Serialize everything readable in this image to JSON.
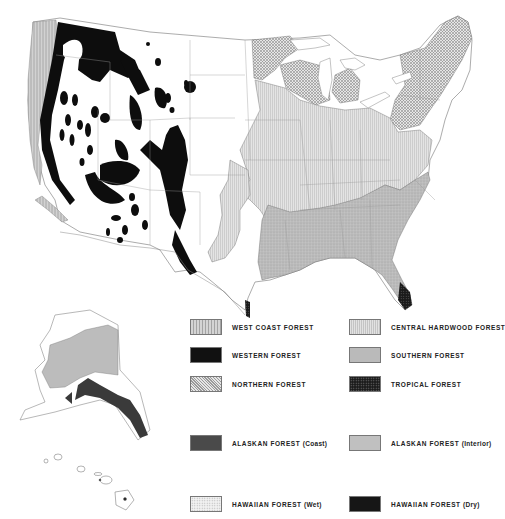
{
  "map": {
    "subject": "Forest regions of the United States",
    "regions_shown": [
      "Contiguous United States",
      "Alaska",
      "Hawaii"
    ]
  },
  "legend": {
    "items": [
      {
        "id": "west-coast",
        "label": "WEST COAST FOREST",
        "sub": "",
        "color": "#c4c4c4",
        "pattern": "vertical-lines"
      },
      {
        "id": "western",
        "label": "WESTERN FOREST",
        "sub": "",
        "color": "#111111",
        "pattern": "solid"
      },
      {
        "id": "northern",
        "label": "NORTHERN FOREST",
        "sub": "",
        "color": "#d6d6d6",
        "pattern": "crosshatch"
      },
      {
        "id": "central-hardwood",
        "label": "CENTRAL HARDWOOD FOREST",
        "sub": "",
        "color": "#dedede",
        "pattern": "fine-vertical"
      },
      {
        "id": "southern",
        "label": "SOUTHERN FOREST",
        "sub": "",
        "color": "#b8b8b8",
        "pattern": "stipple"
      },
      {
        "id": "tropical",
        "label": "TROPICAL FOREST",
        "sub": "",
        "color": "#222222",
        "pattern": "dots"
      },
      {
        "id": "alaskan-coast",
        "label": "ALASKAN FOREST",
        "sub": "(Coast)",
        "color": "#4a4a4a",
        "pattern": "solid"
      },
      {
        "id": "alaskan-interior",
        "label": "ALASKAN FOREST",
        "sub": "(Interior)",
        "color": "#bdbdbd",
        "pattern": "solid"
      },
      {
        "id": "hawaiian-wet",
        "label": "HAWAIIAN FOREST",
        "sub": "(Wet)",
        "color": "#ececec",
        "pattern": "fine-dots"
      },
      {
        "id": "hawaiian-dry",
        "label": "HAWAIIAN FOREST",
        "sub": "(Dry)",
        "color": "#161616",
        "pattern": "solid"
      }
    ]
  }
}
